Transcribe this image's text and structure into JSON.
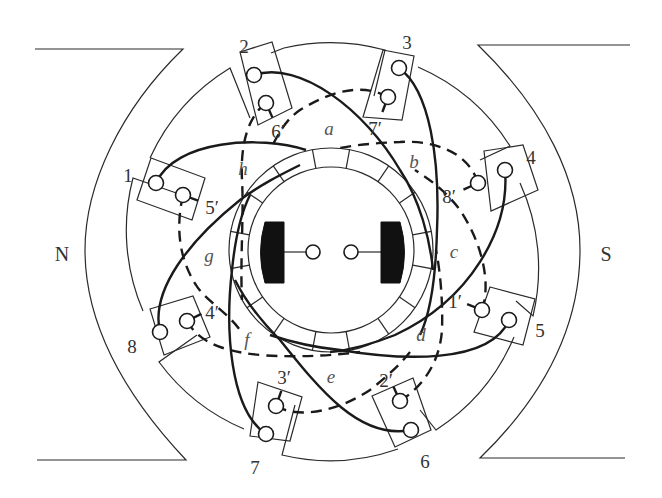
{
  "figure": {
    "colors": {
      "line": "#1a1a1a",
      "brush": "#111111",
      "text": "#333333",
      "background": "#ffffff"
    }
  },
  "poles": [
    {
      "label": "N",
      "x": 62,
      "y": 254
    },
    {
      "label": "S",
      "x": 606,
      "y": 254
    }
  ],
  "center": {
    "x": 331,
    "y": 250
  },
  "commutator": {
    "outer_r": 102,
    "inner_r": 83,
    "segments": 8,
    "segment_offset_deg": -112.5
  },
  "brushes": [
    {
      "side": "left",
      "x": 259,
      "y": 222,
      "w": 25,
      "h": 61,
      "terminal": {
        "x": 313,
        "y": 252
      }
    },
    {
      "side": "right",
      "x": 381,
      "y": 222,
      "w": 25,
      "h": 61,
      "terminal": {
        "x": 351,
        "y": 252
      }
    }
  ],
  "coil_terminals": [
    {
      "label": "1",
      "x": 128,
      "y": 175
    },
    {
      "label": "2",
      "x": 244,
      "y": 46
    },
    {
      "label": "3",
      "x": 407,
      "y": 42
    },
    {
      "label": "4",
      "x": 531,
      "y": 157
    },
    {
      "label": "5",
      "x": 540,
      "y": 330
    },
    {
      "label": "6",
      "x": 425,
      "y": 461
    },
    {
      "label": "7",
      "x": 255,
      "y": 467
    },
    {
      "label": "8",
      "x": 132,
      "y": 346
    }
  ],
  "coil_return_labels": [
    {
      "label": "5′",
      "x": 212,
      "y": 207
    },
    {
      "label": "6′",
      "x": 278,
      "y": 131
    },
    {
      "label": "7′",
      "x": 375,
      "y": 128
    },
    {
      "label": "8′",
      "x": 449,
      "y": 196
    },
    {
      "label": "1′",
      "x": 455,
      "y": 301
    },
    {
      "label": "2′",
      "x": 386,
      "y": 380
    },
    {
      "label": "3′",
      "x": 284,
      "y": 377
    },
    {
      "label": "4′",
      "x": 212,
      "y": 312
    }
  ],
  "segment_labels": [
    {
      "label": "a",
      "x": 329,
      "y": 128
    },
    {
      "label": "b",
      "x": 414,
      "y": 161
    },
    {
      "label": "c",
      "x": 454,
      "y": 251
    },
    {
      "label": "d",
      "x": 421,
      "y": 334
    },
    {
      "label": "e",
      "x": 331,
      "y": 376
    },
    {
      "label": "f",
      "x": 247,
      "y": 339
    },
    {
      "label": "g",
      "x": 209,
      "y": 255
    },
    {
      "label": "h",
      "x": 243,
      "y": 168
    }
  ],
  "terminals_outer": [
    [
      156,
      183
    ],
    [
      254,
      75
    ],
    [
      399,
      68
    ],
    [
      505,
      170
    ],
    [
      509,
      320
    ],
    [
      411,
      430
    ],
    [
      266,
      434
    ],
    [
      160,
      332
    ]
  ],
  "terminals_inner": [
    [
      183,
      195
    ],
    [
      266,
      103
    ],
    [
      388,
      97
    ],
    [
      478,
      183
    ],
    [
      482,
      310
    ],
    [
      400,
      401
    ],
    [
      276,
      406
    ],
    [
      187,
      321
    ]
  ],
  "slot_boxes": [
    [
      [
        151,
        158
      ],
      [
        205,
        178
      ],
      [
        192,
        220
      ],
      [
        137,
        200
      ]
    ],
    [
      [
        240,
        52
      ],
      [
        272,
        42
      ],
      [
        292,
        108
      ],
      [
        258,
        125
      ]
    ],
    [
      [
        383,
        50
      ],
      [
        414,
        56
      ],
      [
        402,
        120
      ],
      [
        363,
        117
      ]
    ],
    [
      [
        484,
        151
      ],
      [
        523,
        145
      ],
      [
        538,
        190
      ],
      [
        491,
        211
      ]
    ],
    [
      [
        490,
        287
      ],
      [
        535,
        299
      ],
      [
        523,
        345
      ],
      [
        474,
        332
      ]
    ],
    [
      [
        372,
        396
      ],
      [
        413,
        378
      ],
      [
        431,
        430
      ],
      [
        395,
        447
      ]
    ],
    [
      [
        258,
        382
      ],
      [
        302,
        397
      ],
      [
        290,
        441
      ],
      [
        250,
        436
      ]
    ],
    [
      [
        150,
        309
      ],
      [
        193,
        296
      ],
      [
        210,
        337
      ],
      [
        164,
        355
      ]
    ]
  ],
  "teeth": [
    [
      [
        169,
        218
      ],
      [
        186,
        158
      ],
      [
        150,
        120
      ],
      [
        222,
        74
      ]
    ],
    [
      [
        270,
        53
      ],
      [
        278,
        45
      ],
      [
        385,
        45
      ],
      [
        385,
        50
      ]
    ],
    [
      [
        418,
        67
      ],
      [
        427,
        62
      ],
      [
        506,
        117
      ],
      [
        510,
        146
      ]
    ],
    [
      [
        520,
        183
      ],
      [
        528,
        183
      ],
      [
        533,
        316
      ],
      [
        525,
        315
      ]
    ],
    [
      [
        514,
        337
      ],
      [
        514,
        345
      ],
      [
        436,
        430
      ],
      [
        430,
        422
      ]
    ],
    [
      [
        398,
        449
      ],
      [
        396,
        456
      ],
      [
        282,
        455
      ],
      [
        284,
        447
      ]
    ],
    [
      [
        244,
        429
      ],
      [
        241,
        437
      ],
      [
        159,
        362
      ],
      [
        166,
        355
      ]
    ],
    [
      [
        143,
        311
      ],
      [
        136,
        312
      ],
      [
        133,
        178
      ],
      [
        141,
        178
      ]
    ]
  ],
  "solid_paths": [
    "M156,183 C175,140 260,135 306,150",
    "M254,75 C300,60 365,110 400,170 C420,200 430,240 433,270",
    "M399,68 C430,90 440,160 437,230 C436,270 432,310 420,335",
    "M505,170 C510,230 470,300 395,335 C370,345 350,350 330,352",
    "M509,320 C490,365 400,360 340,350 C320,348 300,345 270,335",
    "M411,430 C360,440 320,390 280,340 C260,320 245,300 235,280",
    "M266,434 C230,410 225,330 232,270 C235,240 240,215 250,195",
    "M160,332 C150,290 190,240 240,200 C260,185 280,175 300,165"
  ],
  "dashed_paths": [
    "M183,195 C175,230 180,260 196,285 C205,300 225,310 240,330",
    "M266,103 C250,115 240,140 242,180 C244,215 240,260 242,300",
    "M388,97 C360,82 330,92 300,110 C285,120 278,135 270,150",
    "M478,183 C468,150 430,140 400,142 C370,143 350,146 340,148",
    "M482,310 C492,280 480,240 460,210 C445,190 430,180 415,170",
    "M400,401 C425,385 440,360 442,330 C443,300 440,270 436,250",
    "M276,406 C300,420 340,410 370,390 C385,378 400,365 410,352",
    "M187,321 C200,345 230,352 260,355 C300,358 335,355 360,352"
  ]
}
